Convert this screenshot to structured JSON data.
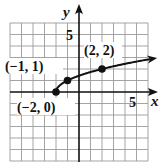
{
  "chart_data": {
    "type": "line",
    "title": "",
    "function": "y = sqrt(x + 2)",
    "xlabel": "x",
    "ylabel": "y",
    "xlim": [
      -6,
      6
    ],
    "ylim": [
      -6,
      6
    ],
    "grid": true,
    "grid_step": 1,
    "tick_labels": {
      "x": [
        {
          "value": 5,
          "label": "5"
        }
      ],
      "y": [
        {
          "value": 5,
          "label": "5"
        }
      ]
    },
    "series": [
      {
        "name": "curve",
        "x": [
          -2,
          -1.75,
          -1.5,
          -1,
          0,
          1,
          2,
          3,
          4,
          5,
          6
        ],
        "y": [
          0,
          0.5,
          0.707,
          1,
          1.414,
          1.732,
          2,
          2.236,
          2.449,
          2.646,
          2.828
        ],
        "arrow_end": true
      }
    ],
    "points": [
      {
        "x": -2,
        "y": 0,
        "label": "(−2, 0)"
      },
      {
        "x": -1,
        "y": 1,
        "label": "(−1, 1)"
      },
      {
        "x": 2,
        "y": 2,
        "label": "(2, 2)"
      }
    ]
  },
  "labels": {
    "x_axis": "x",
    "y_axis": "y",
    "x_tick_5": "5",
    "y_tick_5": "5",
    "point_a": "(−2, 0)",
    "point_b": "(−1, 1)",
    "point_c": "(2, 2)"
  },
  "colors": {
    "grid": "#9a9a9a",
    "axis": "#111111",
    "curve": "#111111",
    "background": "#ffffff"
  }
}
